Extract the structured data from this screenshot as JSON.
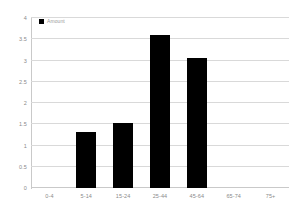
{
  "chart_data": {
    "type": "bar",
    "title": "",
    "subtitle": "",
    "xlabel": "",
    "ylabel": "",
    "categories": [
      "0-4",
      "5-14",
      "15-24",
      "25-44",
      "45-64",
      "65-74",
      "75+"
    ],
    "values": [
      0,
      1.31,
      1.53,
      3.61,
      3.07,
      0,
      0
    ],
    "series": [
      {
        "name": "Amount",
        "values": [
          0,
          1.31,
          1.53,
          3.61,
          3.07,
          0,
          0
        ],
        "color": "#000000"
      }
    ],
    "ylim": [
      0,
      4
    ],
    "ytick_step": 0.5,
    "yticks": [
      0,
      0.5,
      1,
      1.5,
      2,
      2.5,
      3,
      3.5,
      4
    ],
    "ytick_labels": [
      "0",
      "0.5",
      "1",
      "1.5",
      "2",
      "2.5",
      "3",
      "3.5",
      "4"
    ],
    "grid": true,
    "grid_axis": "y",
    "grid_color": "#d9d9d9",
    "legend": true,
    "legend_position": "top-left",
    "legend_entries": [
      {
        "label": "Amount",
        "color": "#000000"
      }
    ],
    "bar_color": "#000000",
    "background_color": "#ffffff",
    "axis_color": "#c9c9c9",
    "tick_label_color": "#8a8a8a"
  }
}
